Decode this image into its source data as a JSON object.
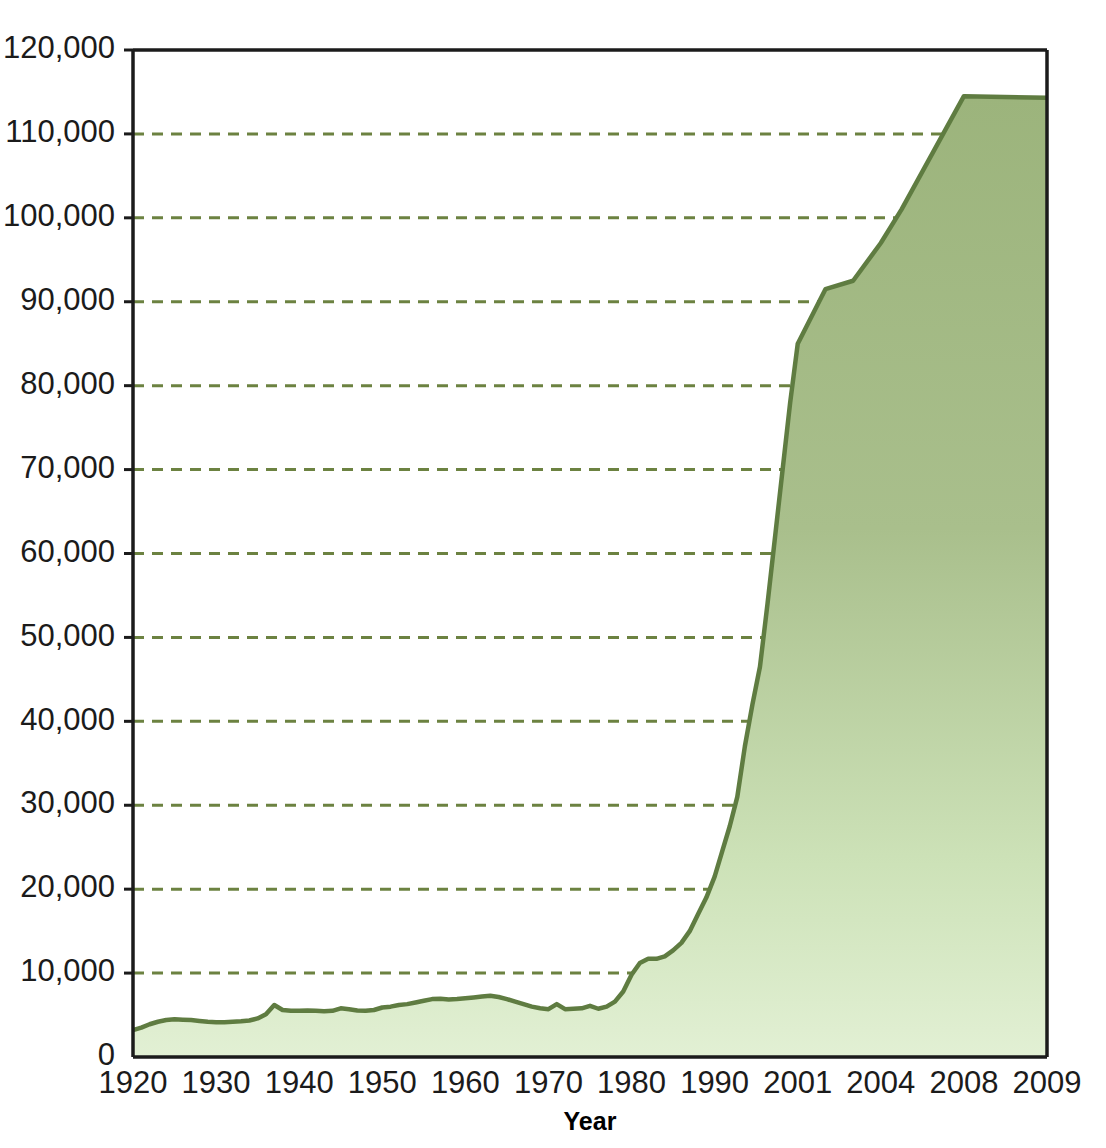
{
  "chart_data": {
    "type": "area",
    "title": "",
    "subtitle": "",
    "xlabel": "Year",
    "ylabel": "",
    "grid": true,
    "legend": false,
    "legend_position": "none",
    "ylim": [
      0,
      120000
    ],
    "ytick_labels": [
      "0",
      "10,000",
      "20,000",
      "30,000",
      "40,000",
      "50,000",
      "60,000",
      "70,000",
      "80,000",
      "90,000",
      "100,000",
      "110,000",
      "120,000"
    ],
    "ytick_values": [
      0,
      10000,
      20000,
      30000,
      40000,
      50000,
      60000,
      70000,
      80000,
      90000,
      100000,
      110000,
      120000
    ],
    "xtick_labels": [
      "1920",
      "1930",
      "1940",
      "1950",
      "1960",
      "1970",
      "1980",
      "1990",
      "2001",
      "2004",
      "2008",
      "2009"
    ],
    "xtick_values": [
      1920,
      1930,
      1940,
      1950,
      1960,
      1970,
      1980,
      1990,
      2001,
      2004,
      2008,
      2009
    ],
    "x": [
      1920,
      1921,
      1922,
      1923,
      1924,
      1925,
      1926,
      1927,
      1928,
      1929,
      1930,
      1931,
      1932,
      1933,
      1934,
      1935,
      1936,
      1937,
      1938,
      1939,
      1940,
      1941,
      1942,
      1943,
      1944,
      1945,
      1946,
      1947,
      1948,
      1949,
      1950,
      1951,
      1952,
      1953,
      1954,
      1955,
      1956,
      1957,
      1958,
      1959,
      1960,
      1961,
      1962,
      1963,
      1964,
      1965,
      1966,
      1967,
      1968,
      1969,
      1970,
      1971,
      1972,
      1973,
      1974,
      1975,
      1976,
      1977,
      1978,
      1979,
      1980,
      1981,
      1982,
      1983,
      1984,
      1985,
      1986,
      1987,
      1988,
      1989,
      1990,
      1991,
      1992,
      1993,
      1994,
      1995,
      1996,
      1997,
      1998,
      1999,
      2000,
      2001,
      2002,
      2003,
      2004,
      2005,
      2006,
      2007,
      2008,
      2009
    ],
    "values": [
      3200,
      3500,
      3900,
      4200,
      4400,
      4500,
      4450,
      4400,
      4300,
      4200,
      4150,
      4150,
      4200,
      4250,
      4350,
      4600,
      5100,
      6200,
      5600,
      5500,
      5500,
      5550,
      5500,
      5450,
      5500,
      5800,
      5700,
      5550,
      5500,
      5600,
      5900,
      6000,
      6200,
      6300,
      6500,
      6700,
      6900,
      6950,
      6850,
      6900,
      7000,
      7100,
      7200,
      7300,
      7150,
      6900,
      6600,
      6300,
      6000,
      5800,
      5700,
      6300,
      5700,
      5750,
      5800,
      6100,
      5750,
      6000,
      6600,
      7800,
      9800,
      11200,
      11700,
      11700,
      12000,
      12700,
      13600,
      15000,
      17000,
      19000,
      21500,
      24500,
      27500,
      31000,
      37000,
      42000,
      46500,
      54000,
      62000,
      70000,
      78000,
      85000,
      91500,
      92500,
      97000,
      101000,
      105500,
      110000,
      114500,
      114300
    ],
    "colors": {
      "line": "#5f7c41",
      "fill_top": "#9cb47c",
      "fill_bottom": "#e0efd0",
      "gridline": "#6c8241",
      "axis": "#1b1b1b",
      "label_text": "#1b1b1b",
      "background": "#ffffff"
    }
  }
}
